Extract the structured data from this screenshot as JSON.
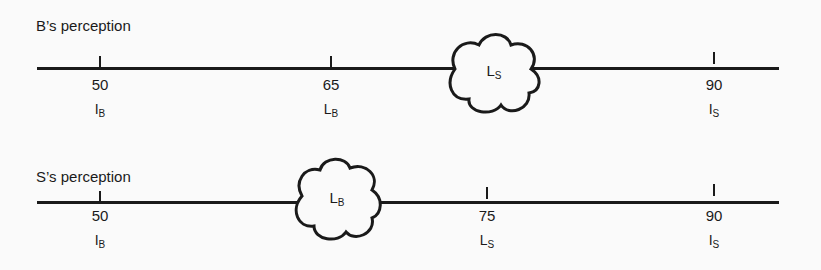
{
  "diagrams": [
    {
      "title": "B’s perception",
      "ticks": [
        {
          "value": "50",
          "label_main": "I",
          "label_sub": "B"
        },
        {
          "value": "65",
          "label_main": "L",
          "label_sub": "B"
        },
        {
          "value": "90",
          "label_main": "I",
          "label_sub": "S"
        }
      ],
      "cloud": {
        "label_main": "L",
        "label_sub": "S"
      }
    },
    {
      "title": "S’s perception",
      "ticks": [
        {
          "value": "50",
          "label_main": "I",
          "label_sub": "B"
        },
        {
          "value": "75",
          "label_main": "L",
          "label_sub": "S"
        },
        {
          "value": "90",
          "label_main": "I",
          "label_sub": "S"
        }
      ],
      "cloud": {
        "label_main": "L",
        "label_sub": "B"
      }
    }
  ]
}
